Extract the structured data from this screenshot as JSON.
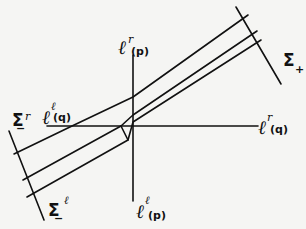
{
  "diagram": {
    "background": "#f5f5f3",
    "stroke_color": "#111111",
    "axes": {
      "vertical": {
        "x": 133,
        "y1": 55,
        "y2": 201
      },
      "horizontal": {
        "y": 126,
        "x1": 47,
        "x2": 258
      }
    },
    "boundaries": {
      "sigma_plus": {
        "x1": 236,
        "y1": 7,
        "x2": 281,
        "y2": 84
      },
      "sigma_minus": {
        "x1": 9,
        "y1": 131,
        "x2": 44,
        "y2": 220
      }
    },
    "beam_lines": [
      {
        "name": "upper",
        "points": "14,154 72,126 133,97 248,15"
      },
      {
        "name": "middle",
        "points": "23,180 121,126 133,115 257,31"
      },
      {
        "name": "lower",
        "points": "27,197 128,140 133,122 261,40"
      }
    ],
    "kink_segment": {
      "points": "121,126 128,140"
    },
    "labels": {
      "l_r_p": {
        "base": "ℓ",
        "sup": "r",
        "sub": "(p)"
      },
      "l_l_p": {
        "base": "ℓ",
        "sup": "ℓ",
        "sub": "(p)"
      },
      "l_r_q": {
        "base": "ℓ",
        "sup": "r",
        "sub": "(q)"
      },
      "l_l_q": {
        "base": "ℓ",
        "sup": "ℓ",
        "sub": "(q)"
      },
      "sigma_plus": {
        "base": "Σ",
        "sub": "+"
      },
      "sigma_minus_r": {
        "base": "Σ",
        "sup": "r",
        "sub": "−"
      },
      "sigma_minus_l": {
        "base": "Σ",
        "sup": "ℓ",
        "sub": "−"
      }
    }
  }
}
